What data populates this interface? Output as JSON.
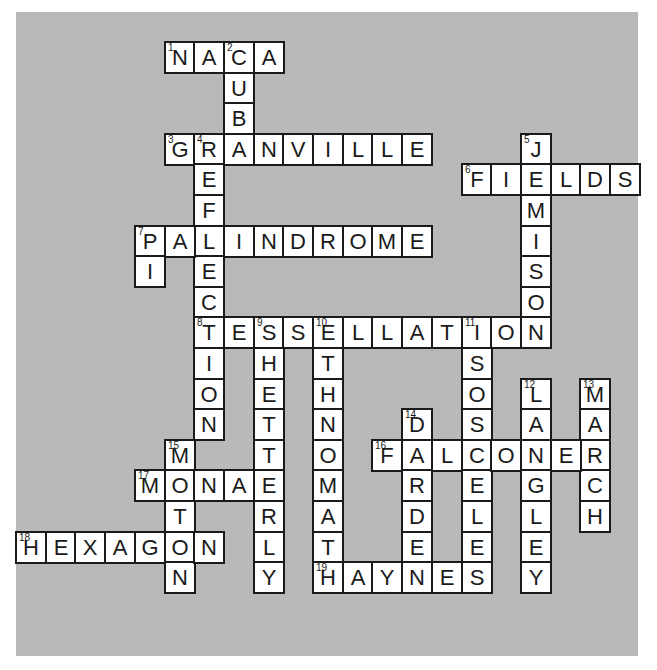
{
  "puzzle": {
    "background_color": "#b9b9b9",
    "cell_color": "#ffffff",
    "ink_color": "#1a1a1a",
    "grid": {
      "origin_x": 15,
      "origin_y": 41,
      "cell_w": 29.7,
      "cell_h": 30.6
    },
    "entries": [
      {
        "number": 1,
        "direction": "across",
        "answer": "NACA",
        "col": 5,
        "row": 0
      },
      {
        "number": 2,
        "direction": "down",
        "answer": "CUBA",
        "col": 7,
        "row": 0
      },
      {
        "number": 3,
        "direction": "across",
        "answer": "GRANVILLE",
        "col": 5,
        "row": 3
      },
      {
        "number": 4,
        "direction": "down",
        "answer": "REFLECTION",
        "col": 6,
        "row": 3
      },
      {
        "number": 5,
        "direction": "down",
        "answer": "JEMISON",
        "col": 17,
        "row": 3
      },
      {
        "number": 6,
        "direction": "across",
        "answer": "FIELDS",
        "col": 15,
        "row": 4
      },
      {
        "number": 7,
        "direction": "across",
        "answer": "PALINDROME",
        "col": 4,
        "row": 6
      },
      {
        "number": 7,
        "direction": "down",
        "answer": "PI",
        "col": 4,
        "row": 6
      },
      {
        "number": 8,
        "direction": "across",
        "answer": "TESSELLATION",
        "col": 6,
        "row": 9
      },
      {
        "number": 9,
        "direction": "down",
        "answer": "SHETTERLY",
        "col": 8,
        "row": 9
      },
      {
        "number": 10,
        "direction": "down",
        "answer": "ETHNOMATH",
        "col": 10,
        "row": 9
      },
      {
        "number": 11,
        "direction": "down",
        "answer": "ISOSCELES",
        "col": 15,
        "row": 9
      },
      {
        "number": 12,
        "direction": "down",
        "answer": "LANGLEY",
        "col": 17,
        "row": 11
      },
      {
        "number": 13,
        "direction": "down",
        "answer": "MARCH",
        "col": 19,
        "row": 11
      },
      {
        "number": 14,
        "direction": "down",
        "answer": "DARDEN",
        "col": 13,
        "row": 12
      },
      {
        "number": 15,
        "direction": "down",
        "answer": "MOTON",
        "col": 5,
        "row": 13
      },
      {
        "number": 16,
        "direction": "across",
        "answer": "FALCONER",
        "col": 12,
        "row": 13
      },
      {
        "number": 17,
        "direction": "across",
        "answer": "MONAE",
        "col": 4,
        "row": 14
      },
      {
        "number": 18,
        "direction": "across",
        "answer": "HEXAGON",
        "col": 0,
        "row": 16
      },
      {
        "number": 19,
        "direction": "across",
        "answer": "HAYNES",
        "col": 10,
        "row": 17
      }
    ]
  }
}
